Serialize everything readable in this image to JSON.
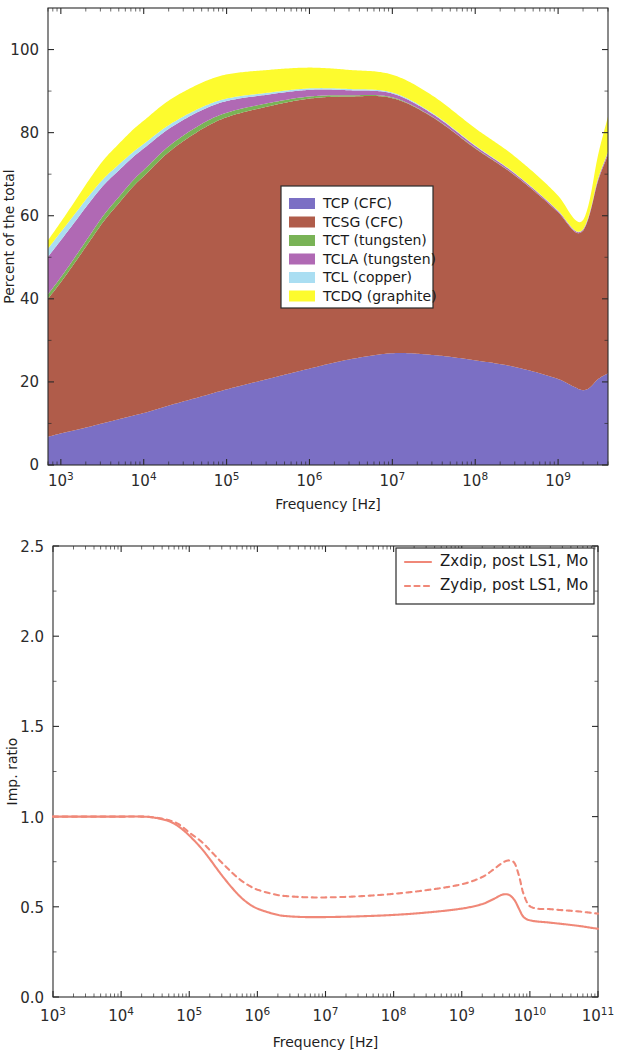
{
  "page": {
    "width": 622,
    "height": 1050,
    "background": "#ffffff"
  },
  "chart_data": [
    {
      "id": "stacked-contribution",
      "type": "area",
      "stacked": true,
      "title": "",
      "xlabel": "Frequency [Hz]",
      "ylabel": "Percent of the total",
      "xscale": "log",
      "yscale": "linear",
      "xlim": [
        700,
        4000000000
      ],
      "ylim": [
        0,
        110
      ],
      "xticklabels": [
        "10^3",
        "10^4",
        "10^5",
        "10^6",
        "10^7",
        "10^8",
        "10^9"
      ],
      "xtickvalues": [
        1000,
        10000,
        100000,
        1000000,
        10000000,
        100000000,
        1000000000
      ],
      "yticklabels": [
        "0",
        "20",
        "40",
        "60",
        "80",
        "100"
      ],
      "ytickvalues": [
        0,
        20,
        40,
        60,
        80,
        100
      ],
      "grid": false,
      "legend_position": "center",
      "legend_entries": [
        "TCP (CFC)",
        "TCSG (CFC)",
        "TCT (tungsten)",
        "TCLA (tungsten)",
        "TCL (copper)",
        "TCDQ (graphite)"
      ],
      "colors": {
        "TCP (CFC)": "#7b6fc4",
        "TCSG (CFC)": "#b05c4a",
        "TCT (tungsten)": "#79b356",
        "TCLA (tungsten)": "#b069b4",
        "TCL (copper)": "#aadef2",
        "TCDQ (graphite)": "#fdfb2e"
      },
      "x": [
        700,
        1000,
        1500,
        2200,
        3300,
        5000,
        7500,
        10000,
        20000,
        50000,
        100000,
        300000,
        1000000,
        3000000,
        10000000,
        30000000,
        100000000,
        300000000,
        1000000000,
        1600000000,
        2000000000,
        2400000000,
        3000000000,
        4000000000
      ],
      "series": [
        {
          "name": "TCP (CFC)",
          "values": [
            6.8,
            7.6,
            8.4,
            9.2,
            10.1,
            11.0,
            11.9,
            12.5,
            14.3,
            16.5,
            18.2,
            20.6,
            23.2,
            25.4,
            26.9,
            26.5,
            25.2,
            23.6,
            20.7,
            18.7,
            18.0,
            18.6,
            20.6,
            22.1
          ]
        },
        {
          "name": "TCSG (CFC)",
          "values": [
            33.2,
            36.4,
            40.5,
            44.5,
            48.6,
            52.0,
            55.2,
            57.0,
            61.0,
            64.3,
            65.5,
            65.6,
            65.0,
            63.3,
            61.4,
            57.3,
            51.0,
            46.1,
            40.1,
            37.4,
            38.4,
            41.7,
            47.5,
            52.6
          ]
        },
        {
          "name": "TCT (tungsten)",
          "values": [
            1.1,
            1.2,
            1.3,
            1.4,
            1.5,
            1.5,
            1.5,
            1.5,
            1.4,
            1.3,
            1.1,
            0.8,
            0.5,
            0.3,
            0.2,
            0.1,
            0.1,
            0.05,
            0.03,
            0.02,
            0.02,
            0.02,
            0.03,
            0.05
          ]
        },
        {
          "name": "TCLA (tungsten)",
          "values": [
            9.0,
            8.9,
            8.5,
            8.0,
            7.2,
            6.4,
            5.6,
            5.2,
            4.2,
            3.3,
            2.8,
            2.1,
            1.6,
            1.2,
            0.9,
            0.7,
            0.5,
            0.4,
            0.3,
            0.25,
            0.25,
            0.3,
            0.4,
            0.5
          ]
        },
        {
          "name": "TCL (copper)",
          "values": [
            2.0,
            2.0,
            1.9,
            1.8,
            1.6,
            1.4,
            1.2,
            1.1,
            0.9,
            0.7,
            0.6,
            0.45,
            0.35,
            0.3,
            0.25,
            0.2,
            0.15,
            0.12,
            0.1,
            0.08,
            0.08,
            0.1,
            0.12,
            0.15
          ]
        },
        {
          "name": "TCDQ (graphite)",
          "values": [
            2.0,
            2.4,
            3.1,
            3.8,
            4.5,
            5.0,
            5.4,
            5.6,
            5.9,
            5.9,
            5.8,
            5.5,
            5.0,
            4.6,
            4.3,
            4.2,
            4.1,
            4.0,
            3.6,
            2.6,
            2.2,
            3.0,
            5.5,
            8.5
          ]
        }
      ]
    },
    {
      "id": "impedance-ratio",
      "type": "line",
      "title": "",
      "xlabel": "Frequency [Hz]",
      "ylabel": "Imp. ratio",
      "xscale": "log",
      "yscale": "linear",
      "xlim": [
        1000,
        100000000000
      ],
      "ylim": [
        0.0,
        2.5
      ],
      "xticklabels": [
        "10^3",
        "10^4",
        "10^5",
        "10^6",
        "10^7",
        "10^8",
        "10^9",
        "10^10",
        "10^11"
      ],
      "xtickvalues": [
        1000,
        10000,
        100000,
        1000000,
        10000000,
        100000000,
        1000000000,
        10000000000,
        100000000000
      ],
      "yticklabels": [
        "0.0",
        "0.5",
        "1.0",
        "1.5",
        "2.0",
        "2.5"
      ],
      "ytickvalues": [
        0.0,
        0.5,
        1.0,
        1.5,
        2.0,
        2.5
      ],
      "grid": false,
      "legend_position": "upper right",
      "legend_entries": [
        "Zxdip, post LS1, Mo",
        "Zydip, post LS1, Mo"
      ],
      "colors": {
        "Zxdip, post LS1, Mo": "#f08878",
        "Zydip, post LS1, Mo": "#f08878"
      },
      "linestyles": {
        "Zxdip, post LS1, Mo": "solid",
        "Zydip, post LS1, Mo": "dashed"
      },
      "x": [
        1000,
        3000,
        10000,
        20000,
        30000,
        50000,
        70000,
        100000,
        150000,
        200000,
        300000,
        500000,
        700000,
        1000000,
        2000000,
        3000000,
        5000000,
        10000000,
        30000000,
        100000000,
        300000000,
        1000000000,
        2000000000,
        3000000000,
        4000000000,
        5000000000,
        6000000000,
        7000000000,
        8000000000,
        10000000000,
        20000000000,
        50000000000,
        100000000000
      ],
      "series": [
        {
          "name": "Zxdip, post LS1, Mo",
          "style": "solid",
          "values": [
            1.0,
            1.0,
            1.0,
            1.0,
            0.995,
            0.975,
            0.945,
            0.895,
            0.825,
            0.765,
            0.675,
            0.575,
            0.525,
            0.49,
            0.455,
            0.447,
            0.443,
            0.443,
            0.447,
            0.455,
            0.468,
            0.49,
            0.515,
            0.545,
            0.568,
            0.565,
            0.535,
            0.485,
            0.445,
            0.425,
            0.412,
            0.395,
            0.378
          ]
        },
        {
          "name": "Zydip, post LS1, Mo",
          "style": "dashed",
          "values": [
            1.0,
            1.0,
            1.0,
            1.0,
            0.996,
            0.98,
            0.958,
            0.912,
            0.862,
            0.815,
            0.745,
            0.665,
            0.625,
            0.595,
            0.565,
            0.558,
            0.553,
            0.552,
            0.558,
            0.572,
            0.592,
            0.625,
            0.665,
            0.71,
            0.745,
            0.757,
            0.74,
            0.665,
            0.575,
            0.503,
            0.487,
            0.475,
            0.462
          ]
        }
      ]
    }
  ]
}
